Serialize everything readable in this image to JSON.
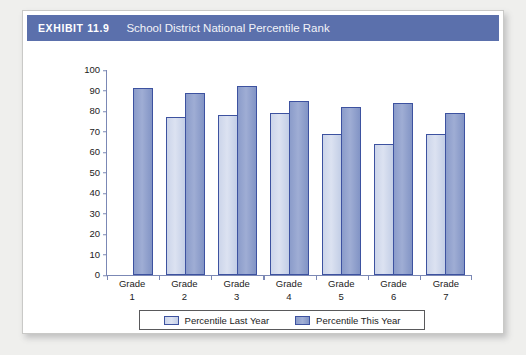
{
  "exhibit": {
    "number": "EXHIBIT 11.9",
    "title": "School District National Percentile Rank"
  },
  "colors": {
    "header_band": "#5b70ac",
    "bar_last_year": "#ccd5ea",
    "bar_this_year": "#8b9cca",
    "bar_border": "#3d52a0",
    "axis": "#7b88b5",
    "page_background": "#efefed"
  },
  "chart_data": {
    "type": "bar",
    "title": "School District National Percentile Rank",
    "xlabel": "",
    "ylabel": "",
    "ylim": [
      0,
      100
    ],
    "yticks": [
      100,
      90,
      80,
      70,
      60,
      50,
      40,
      30,
      20,
      10,
      0
    ],
    "grid": false,
    "legend_position": "bottom",
    "categories": [
      "Grade 1",
      "Grade 2",
      "Grade 3",
      "Grade 4",
      "Grade 5",
      "Grade 6",
      "Grade 7"
    ],
    "category_lines": [
      [
        "Grade",
        "1"
      ],
      [
        "Grade",
        "2"
      ],
      [
        "Grade",
        "3"
      ],
      [
        "Grade",
        "4"
      ],
      [
        "Grade",
        "5"
      ],
      [
        "Grade",
        "6"
      ],
      [
        "Grade",
        "7"
      ]
    ],
    "series": [
      {
        "name": "Percentile Last Year",
        "values": [
          null,
          77,
          78,
          79,
          69,
          64,
          69
        ]
      },
      {
        "name": "Percentile This Year",
        "values": [
          91,
          89,
          92,
          85,
          82,
          84,
          79
        ]
      }
    ]
  },
  "legend": {
    "items": [
      {
        "label": "Percentile Last Year",
        "swatch": "last-year"
      },
      {
        "label": "Percentile This Year",
        "swatch": "this-year"
      }
    ]
  }
}
